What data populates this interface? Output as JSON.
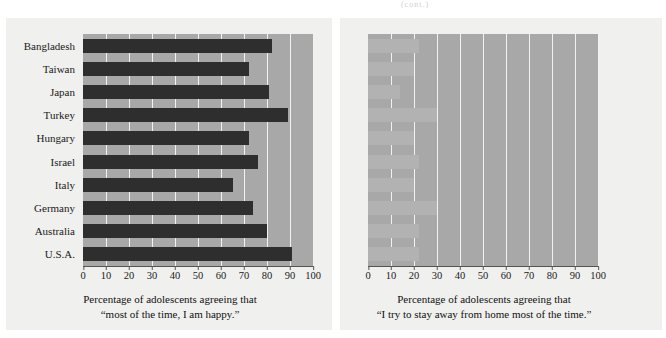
{
  "top_note": "(cont.)",
  "chart_data": [
    {
      "type": "bar",
      "orientation": "horizontal",
      "panel": "left",
      "title": "",
      "xlabel_line1": "Percentage of adolescents agreeing that",
      "xlabel_line2": "“most of the time, I am happy.”",
      "ylabel": "",
      "categories": [
        "Bangladesh",
        "Taiwan",
        "Japan",
        "Turkey",
        "Hungary",
        "Israel",
        "Italy",
        "Germany",
        "Australia",
        "U.S.A."
      ],
      "values": [
        82,
        72,
        81,
        89,
        72,
        76,
        65,
        74,
        80,
        91
      ],
      "xlim": [
        0,
        100
      ],
      "xticks": [
        0,
        10,
        20,
        30,
        40,
        50,
        60,
        70,
        80,
        90,
        100
      ],
      "xticklabels": [
        "0",
        "10",
        "20",
        "30",
        "40",
        "50",
        "60",
        "70",
        "80",
        "90",
        "100"
      ],
      "bar_color": "#2e2e2e",
      "plot_bg": "#a8a8a8",
      "grid": true,
      "grid_color": "#f2f2f2",
      "legend": "none"
    },
    {
      "type": "bar",
      "orientation": "horizontal",
      "panel": "right",
      "title": "",
      "xlabel_line1": "Percentage of adolescents agreeing that",
      "xlabel_line2": "“I try to stay away from home most of the time.”",
      "ylabel": "",
      "categories": [
        "Bangladesh",
        "Taiwan",
        "Japan",
        "Turkey",
        "Hungary",
        "Israel",
        "Italy",
        "Germany",
        "Australia",
        "U.S.A."
      ],
      "values": [
        22,
        20,
        14,
        30,
        20,
        22,
        20,
        30,
        22,
        22
      ],
      "xlim": [
        0,
        100
      ],
      "xticks": [
        0,
        10,
        20,
        30,
        40,
        50,
        60,
        70,
        80,
        90,
        100
      ],
      "xticklabels": [
        "0",
        "10",
        "20",
        "30",
        "40",
        "50",
        "60",
        "70",
        "80",
        "90",
        "100"
      ],
      "bar_color": "#b2b2b2",
      "plot_bg": "#a8a8a8",
      "grid": true,
      "grid_color": "#f2f2f2",
      "legend": "none"
    }
  ]
}
